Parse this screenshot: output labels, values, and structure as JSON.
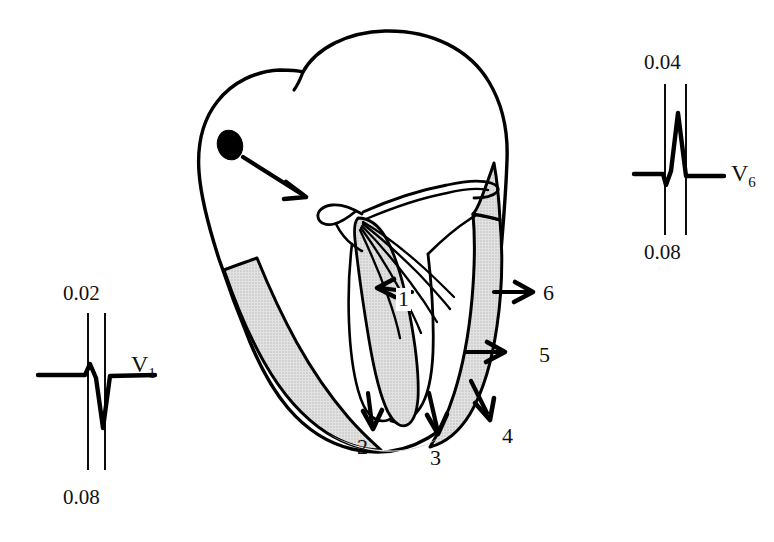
{
  "figure": {
    "background_color": "#ffffff",
    "ink_color": "#000000",
    "myocardium_shading_color": "#d8d8d8"
  },
  "ecg_traces": [
    {
      "id": "v1",
      "lead_label": "V",
      "lead_subscript": "1",
      "top_time_label": "0.02",
      "bottom_time_label": "0.08",
      "morphology": "small R wave followed by deep S wave (rS complex)",
      "baseline_y": 375
    },
    {
      "id": "v6",
      "lead_label": "V",
      "lead_subscript": "6",
      "top_time_label": "0.04",
      "bottom_time_label": "0.08",
      "morphology": "small q wave followed by tall R wave (qR complex)",
      "baseline_y": 174
    }
  ],
  "heart_diagram": {
    "sa_node": {
      "name": "sinoatrial-node",
      "shown_as": "filled black oval"
    },
    "conduction_arrow": {
      "name": "sa-to-av-conduction-arrow",
      "description": "arrow from SA node toward AV node / His bundle"
    },
    "purkinje_fibers": {
      "name": "purkinje-fiber-network",
      "fiber_count": 5
    },
    "depolarization_steps": [
      {
        "number": "1",
        "region": "interventricular septum, left-to-right",
        "direction": "left",
        "boxed_label": true
      },
      {
        "number": "2",
        "region": "right ventricular free wall, apical",
        "direction": "down",
        "boxed_label": false
      },
      {
        "number": "3",
        "region": "apex / inferior wall",
        "direction": "down",
        "boxed_label": false
      },
      {
        "number": "4",
        "region": "left ventricular apical wall",
        "direction": "down-right",
        "boxed_label": false
      },
      {
        "number": "5",
        "region": "left ventricular lateral wall, lower",
        "direction": "right",
        "boxed_label": false
      },
      {
        "number": "6",
        "region": "left ventricular lateral wall, upper / basal",
        "direction": "right",
        "boxed_label": false
      }
    ]
  },
  "labels": {
    "v1_time_top": "0.02",
    "v1_time_bottom": "0.08",
    "v1_lead": "V",
    "v1_lead_sub": "1",
    "v6_time_top": "0.04",
    "v6_time_bottom": "0.08",
    "v6_lead": "V",
    "v6_lead_sub": "6",
    "step_1": "1",
    "step_2": "2",
    "step_3": "3",
    "step_4": "4",
    "step_5": "5",
    "step_6": "6"
  }
}
